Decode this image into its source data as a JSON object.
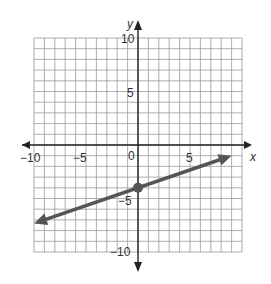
{
  "chart_data": {
    "type": "line",
    "title": "",
    "xlabel": "x",
    "ylabel": "y",
    "xlim": [
      -10,
      10
    ],
    "ylim": [
      -10,
      10
    ],
    "grid": true,
    "x_tick_labels": [
      "-10",
      "-5",
      "0",
      "5"
    ],
    "y_tick_labels": [
      "10",
      "5",
      "-5",
      "-10"
    ],
    "series": [
      {
        "name": "line",
        "equation": "y = (1/3)x - 4",
        "x": [
          -10,
          9
        ],
        "y": [
          -7.33,
          -1
        ],
        "arrows_both_ends": true,
        "color": "#555555"
      }
    ],
    "points": [
      {
        "x": 0,
        "y": -4,
        "label": "y-intercept",
        "color": "#555555"
      }
    ]
  },
  "labels": {
    "x_axis": "x",
    "y_axis": "y",
    "origin": "0",
    "x_neg10": "−10",
    "x_neg5": "−5",
    "x_5": "5",
    "y_10": "10",
    "y_5": "5",
    "y_neg5": "−5",
    "y_neg10": "−10"
  }
}
